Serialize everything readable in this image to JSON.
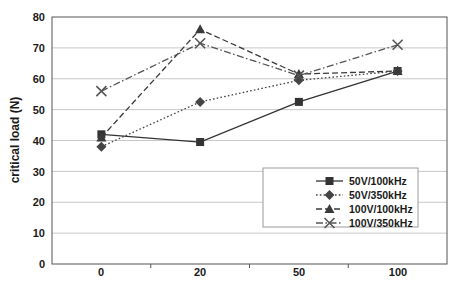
{
  "chart_data": {
    "type": "line",
    "title": "",
    "xlabel": "",
    "ylabel": "critical load (N)",
    "categories": [
      "0",
      "20",
      "50",
      "100"
    ],
    "ylim": [
      0,
      80
    ],
    "yticks": [
      0,
      10,
      20,
      30,
      40,
      50,
      60,
      70,
      80
    ],
    "ytick_labels": [
      "0",
      "10",
      "20",
      "30",
      "40",
      "50",
      "60",
      "70",
      "80"
    ],
    "grid": "horizontal",
    "legend_position": "inside-lower-right",
    "series": [
      {
        "name": "50V/100kHz",
        "values": [
          42,
          39.5,
          52.5,
          62.5
        ],
        "marker": "square",
        "line_style": "solid",
        "color": "#333333"
      },
      {
        "name": "50V/350kHz",
        "values": [
          38,
          52.5,
          59.5,
          62.5
        ],
        "marker": "diamond",
        "line_style": "dotted",
        "color": "#444444"
      },
      {
        "name": "100V/100kHz",
        "values": [
          41,
          76,
          61.5,
          62.5
        ],
        "marker": "triangle",
        "line_style": "dashed",
        "color": "#3a3a3a"
      },
      {
        "name": "100V/350kHz",
        "values": [
          56,
          71.5,
          61,
          71
        ],
        "marker": "x",
        "line_style": "dashdot",
        "color": "#555555"
      }
    ]
  },
  "axis": {
    "y_title": "critical load (N)",
    "y_tick_0": "0",
    "y_tick_10": "10",
    "y_tick_20": "20",
    "y_tick_30": "30",
    "y_tick_40": "40",
    "y_tick_50": "50",
    "y_tick_60": "60",
    "y_tick_70": "70",
    "y_tick_80": "80",
    "x_tick_0": "0",
    "x_tick_1": "20",
    "x_tick_2": "50",
    "x_tick_3": "100"
  },
  "legend": {
    "items": [
      {
        "label": "50V/100kHz"
      },
      {
        "label": "50V/350kHz"
      },
      {
        "label": "100V/100kHz"
      },
      {
        "label": "100V/350kHz"
      }
    ]
  },
  "colors": {
    "plot_border": "#555555",
    "gridline": "#c8c8c8",
    "legend_border": "#9a9a9a",
    "text": "#1a1a1a",
    "background": "#ffffff"
  }
}
